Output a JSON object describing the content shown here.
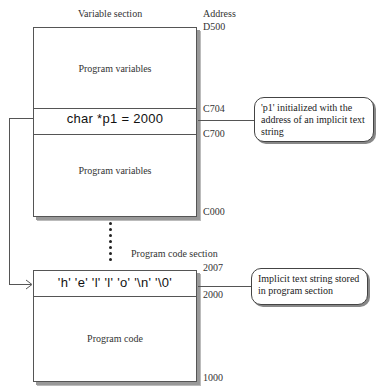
{
  "variable_section": {
    "title": "Variable section",
    "upper_label": "Program variables",
    "pointer_row": "char *p1 = 2000",
    "lower_label": "Program variables"
  },
  "address_header": {
    "line1": "Address",
    "top": "D500"
  },
  "addresses_variable": {
    "c704": "C704",
    "c700": "C700",
    "c000": "C000"
  },
  "program_section": {
    "title": "Program code section",
    "string_row": "'h' 'e' 'l' 'l' 'o' '\\n' '\\0'",
    "label": "Program code"
  },
  "addresses_program": {
    "a2007": "2007",
    "a2000": "2000",
    "a1000": "1000"
  },
  "callouts": {
    "pointer": "'p1' initialized with the address of an implicit text string",
    "string": "Implicit text string stored in program section"
  },
  "continuation_dots": 7
}
